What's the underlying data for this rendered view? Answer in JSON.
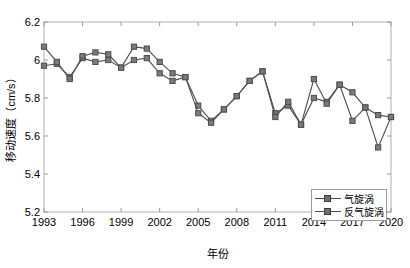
{
  "chart_data": {
    "type": "line",
    "title": "",
    "xlabel": "年份",
    "ylabel": "移动速度（cm/s）",
    "xlim": [
      1993,
      2020
    ],
    "ylim": [
      5.2,
      6.2
    ],
    "xticks": [
      1993,
      1996,
      1999,
      2002,
      2005,
      2008,
      2011,
      2014,
      2017,
      2020
    ],
    "yticks": [
      5.2,
      5.4,
      5.6,
      5.8,
      6,
      6.2
    ],
    "ytick_labels": [
      "5.2",
      "5.4",
      "5.6",
      "5.8",
      "6",
      "6.2"
    ],
    "grid": false,
    "legend_position": "lower right",
    "marker": "square",
    "x": [
      1993,
      1994,
      1995,
      1996,
      1997,
      1998,
      1999,
      2000,
      2001,
      2002,
      2003,
      2004,
      2005,
      2006,
      2007,
      2008,
      2009,
      2010,
      2011,
      2012,
      2013,
      2014,
      2015,
      2016,
      2017,
      2018,
      2019,
      2020
    ],
    "series": [
      {
        "name": "气旋涡",
        "color": "#4d4d4d",
        "values": [
          5.97,
          5.98,
          5.91,
          6.01,
          5.99,
          6.0,
          5.96,
          6.0,
          6.01,
          5.93,
          5.89,
          5.91,
          5.76,
          5.68,
          5.74,
          5.81,
          5.89,
          5.94,
          5.72,
          5.76,
          5.66,
          5.8,
          5.78,
          5.87,
          5.68,
          5.75,
          5.54,
          5.7
        ]
      },
      {
        "name": "反气旋涡",
        "color": "#4d4d4d",
        "values": [
          6.07,
          5.99,
          5.9,
          6.02,
          6.04,
          6.03,
          5.96,
          6.07,
          6.06,
          5.99,
          5.93,
          5.91,
          5.72,
          5.67,
          5.74,
          5.81,
          5.89,
          5.94,
          5.7,
          5.78,
          5.66,
          5.9,
          5.77,
          5.87,
          5.83,
          5.75,
          5.71,
          5.7
        ]
      }
    ]
  },
  "legend": {
    "items": [
      {
        "label": "气旋涡"
      },
      {
        "label": "反气旋涡"
      }
    ]
  }
}
